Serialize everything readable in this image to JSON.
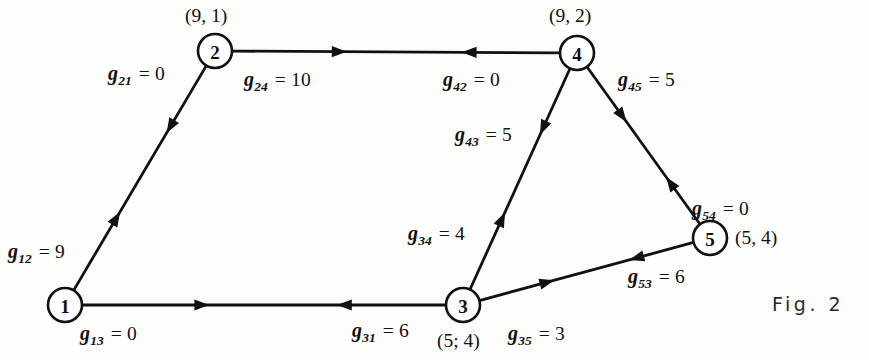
{
  "figure": {
    "caption": "Fig. 2",
    "caption_x": 772,
    "caption_y": 293
  },
  "chart_data": {
    "type": "diagram",
    "title": "Fig. 2",
    "nodes": [
      {
        "id": "1",
        "label": "1",
        "cx": 65,
        "cy": 305,
        "r": 17,
        "annot": "",
        "annot_x": 0,
        "annot_y": 0
      },
      {
        "id": "2",
        "label": "2",
        "cx": 215,
        "cy": 51,
        "r": 17,
        "annot": "(9, 1)",
        "annot_x": 185,
        "annot_y": 5
      },
      {
        "id": "3",
        "label": "3",
        "cx": 463,
        "cy": 305,
        "r": 17,
        "annot": "(5; 4)",
        "annot_x": 437,
        "annot_y": 330
      },
      {
        "id": "4",
        "label": "4",
        "cx": 577,
        "cy": 53,
        "r": 17,
        "annot": "(9, 2)",
        "annot_x": 549,
        "annot_y": 5
      },
      {
        "id": "5",
        "label": "5",
        "cx": 710,
        "cy": 238,
        "r": 17,
        "annot": "(5, 4)",
        "annot_x": 735,
        "annot_y": 227
      }
    ],
    "edges": [
      {
        "from": "1",
        "to": "2",
        "bidirectional": true
      },
      {
        "from": "2",
        "to": "4",
        "bidirectional": true
      },
      {
        "from": "1",
        "to": "3",
        "bidirectional": true
      },
      {
        "from": "3",
        "to": "4",
        "bidirectional": true
      },
      {
        "from": "4",
        "to": "5",
        "bidirectional": true
      },
      {
        "from": "3",
        "to": "5",
        "bidirectional": true
      }
    ],
    "edge_labels": [
      {
        "name": "g12",
        "sym": "g",
        "sub": "12",
        "value": "9",
        "text": "g12 = 9",
        "x": 8,
        "y": 240
      },
      {
        "name": "g21",
        "sym": "g",
        "sub": "21",
        "value": "0",
        "text": "g21 = 0",
        "x": 108,
        "y": 62
      },
      {
        "name": "g24",
        "sym": "g",
        "sub": "24",
        "value": "10",
        "text": "g24 = 10",
        "x": 244,
        "y": 68
      },
      {
        "name": "g42",
        "sym": "g",
        "sub": "42",
        "value": "0",
        "text": "g42 = 0",
        "x": 443,
        "y": 68
      },
      {
        "name": "g45",
        "sym": "g",
        "sub": "45",
        "value": "5",
        "text": "g45 = 5",
        "x": 618,
        "y": 68
      },
      {
        "name": "g43",
        "sym": "g",
        "sub": "43",
        "value": "5",
        "text": "g43 = 5",
        "x": 455,
        "y": 123
      },
      {
        "name": "g54",
        "sym": "g",
        "sub": "54",
        "value": "0",
        "text": "g54 = 0",
        "x": 692,
        "y": 197
      },
      {
        "name": "g34",
        "sym": "g",
        "sub": "34",
        "value": "4",
        "text": "g34 = 4",
        "x": 408,
        "y": 222
      },
      {
        "name": "g53",
        "sym": "g",
        "sub": "53",
        "value": "6",
        "text": "g53 = 6",
        "x": 628,
        "y": 265
      },
      {
        "name": "g13",
        "sym": "g",
        "sub": "13",
        "value": "0",
        "text": "g13 = 0",
        "x": 80,
        "y": 322
      },
      {
        "name": "g31",
        "sym": "g",
        "sub": "31",
        "value": "6",
        "text": "g31 = 6",
        "x": 352,
        "y": 319
      },
      {
        "name": "g35",
        "sym": "g",
        "sub": "35",
        "value": "3",
        "text": "g35 = 3",
        "x": 508,
        "y": 322
      }
    ],
    "colors": {
      "ink": "#111111",
      "paper": "#fdfdfb"
    }
  }
}
